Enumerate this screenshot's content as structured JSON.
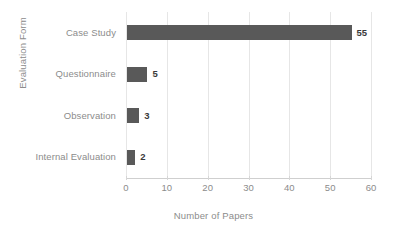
{
  "chart_data": {
    "type": "bar",
    "orientation": "horizontal",
    "title": "",
    "xlabel": "Number of Papers",
    "ylabel": "Evaluation Form",
    "categories": [
      "Case Study",
      "Questionnaire",
      "Observation",
      "Internal Evaluation"
    ],
    "values": [
      55,
      5,
      3,
      2
    ],
    "data_labels": [
      "55",
      "5",
      "3",
      "2"
    ],
    "xlim": [
      0,
      60
    ],
    "xticks": [
      0,
      10,
      20,
      30,
      40,
      50,
      60
    ],
    "xtick_labels": [
      "0",
      "10",
      "20",
      "30",
      "40",
      "50",
      "60"
    ],
    "grid": "vertical",
    "legend": "none",
    "colors": {
      "bar": "#595959",
      "gridline": "#e6e6e6",
      "axis": "#cfcfcf",
      "tick_text": "#8c8c8c",
      "value_text": "#3a3a3a",
      "background": "#ffffff"
    }
  }
}
